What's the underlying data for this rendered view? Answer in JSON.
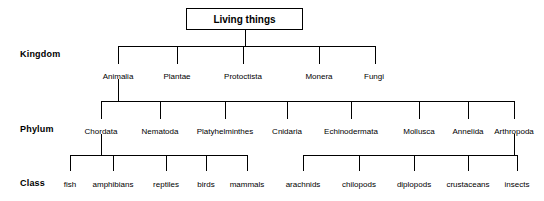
{
  "diagram": {
    "title": "Living things",
    "rank_labels": [
      {
        "text": "Kingdom",
        "x": 20,
        "y": 49
      },
      {
        "text": "Phylum",
        "x": 20,
        "y": 124
      },
      {
        "text": "Class",
        "x": 20,
        "y": 178
      }
    ],
    "root": {
      "text": "Living things",
      "x": 186,
      "y": 8,
      "w": 117,
      "h": 22
    },
    "kingdoms": [
      {
        "text": "Animalia",
        "x": 118,
        "y": 72
      },
      {
        "text": "Plantae",
        "x": 177,
        "y": 72
      },
      {
        "text": "Protoctista",
        "x": 243,
        "y": 72
      },
      {
        "text": "Monera",
        "x": 319,
        "y": 72
      },
      {
        "text": "Fungi",
        "x": 374,
        "y": 72
      }
    ],
    "phyla": [
      {
        "text": "Chordata",
        "x": 101,
        "y": 127
      },
      {
        "text": "Nematoda",
        "x": 160,
        "y": 127
      },
      {
        "text": "Platyhelminthes",
        "x": 225,
        "y": 127
      },
      {
        "text": "Cnidaria",
        "x": 287,
        "y": 127
      },
      {
        "text": "Echinodermata",
        "x": 351,
        "y": 127
      },
      {
        "text": "Mollusca",
        "x": 419,
        "y": 127
      },
      {
        "text": "Annelida",
        "x": 468,
        "y": 127
      },
      {
        "text": "Arthropoda",
        "x": 514,
        "y": 127
      }
    ],
    "classes": [
      {
        "text": "fish",
        "x": 70,
        "y": 180
      },
      {
        "text": "amphibians",
        "x": 113,
        "y": 180
      },
      {
        "text": "reptiles",
        "x": 166,
        "y": 180
      },
      {
        "text": "birds",
        "x": 206,
        "y": 180
      },
      {
        "text": "mammals",
        "x": 247,
        "y": 180
      },
      {
        "text": "arachnids",
        "x": 303,
        "y": 180
      },
      {
        "text": "chilopods",
        "x": 359,
        "y": 180
      },
      {
        "text": "diplopods",
        "x": 414,
        "y": 180
      },
      {
        "text": "crustaceans",
        "x": 468,
        "y": 180
      },
      {
        "text": "insects",
        "x": 517,
        "y": 180
      }
    ],
    "connectors": {
      "root_stem": {
        "x": 245,
        "y": 30,
        "h": 16
      },
      "kingdom_bus": {
        "x": 118,
        "y": 46,
        "w": 257
      },
      "kingdom_drops": [
        {
          "x": 118,
          "y": 46,
          "h": 18
        },
        {
          "x": 177,
          "y": 46,
          "h": 18
        },
        {
          "x": 243,
          "y": 46,
          "h": 18
        },
        {
          "x": 319,
          "y": 46,
          "h": 18
        },
        {
          "x": 375,
          "y": 46,
          "h": 18
        }
      ],
      "animalia_stem": {
        "x": 118,
        "y": 79,
        "h": 22
      },
      "phylum_bus": {
        "x": 101,
        "y": 101,
        "w": 413
      },
      "phylum_drops": [
        {
          "x": 101,
          "y": 101,
          "h": 18
        },
        {
          "x": 160,
          "y": 101,
          "h": 18
        },
        {
          "x": 225,
          "y": 101,
          "h": 18
        },
        {
          "x": 287,
          "y": 101,
          "h": 18
        },
        {
          "x": 351,
          "y": 101,
          "h": 18
        },
        {
          "x": 419,
          "y": 101,
          "h": 18
        },
        {
          "x": 468,
          "y": 101,
          "h": 18
        },
        {
          "x": 514,
          "y": 101,
          "h": 18
        }
      ],
      "chordata_stem": {
        "x": 101,
        "y": 134,
        "h": 21
      },
      "chordata_bus": {
        "x": 70,
        "y": 155,
        "w": 177
      },
      "chordata_drops": [
        {
          "x": 70,
          "y": 155,
          "h": 16
        },
        {
          "x": 113,
          "y": 155,
          "h": 16
        },
        {
          "x": 166,
          "y": 155,
          "h": 16
        },
        {
          "x": 206,
          "y": 155,
          "h": 16
        },
        {
          "x": 247,
          "y": 155,
          "h": 16
        }
      ],
      "arthropoda_stem": {
        "x": 514,
        "y": 134,
        "h": 21
      },
      "arthropoda_bus": {
        "x": 303,
        "y": 155,
        "w": 214
      },
      "arthropoda_drops": [
        {
          "x": 303,
          "y": 155,
          "h": 16
        },
        {
          "x": 359,
          "y": 155,
          "h": 16
        },
        {
          "x": 414,
          "y": 155,
          "h": 16
        },
        {
          "x": 468,
          "y": 155,
          "h": 16
        },
        {
          "x": 517,
          "y": 155,
          "h": 16
        }
      ]
    }
  }
}
